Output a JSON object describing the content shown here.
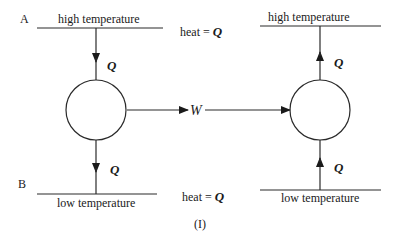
{
  "left": {
    "label_top": "A",
    "label_bottom": "B",
    "top_reservoir": "high temperature",
    "bottom_reservoir": "low temperature",
    "q_in": "Q",
    "q_out": "Q"
  },
  "right": {
    "top_reservoir": "high temperature",
    "bottom_reservoir": "low temperature",
    "q_in": "Q",
    "q_out": "Q"
  },
  "center": {
    "heat_top_prefix": "heat = ",
    "heat_top_q": "Q",
    "heat_bottom_prefix": "heat = ",
    "heat_bottom_q": "Q",
    "work": "W",
    "caption": "(I)"
  },
  "colors": {
    "stroke": "#2a2a2a",
    "text": "#1a1a1a",
    "background": "#ffffff"
  }
}
